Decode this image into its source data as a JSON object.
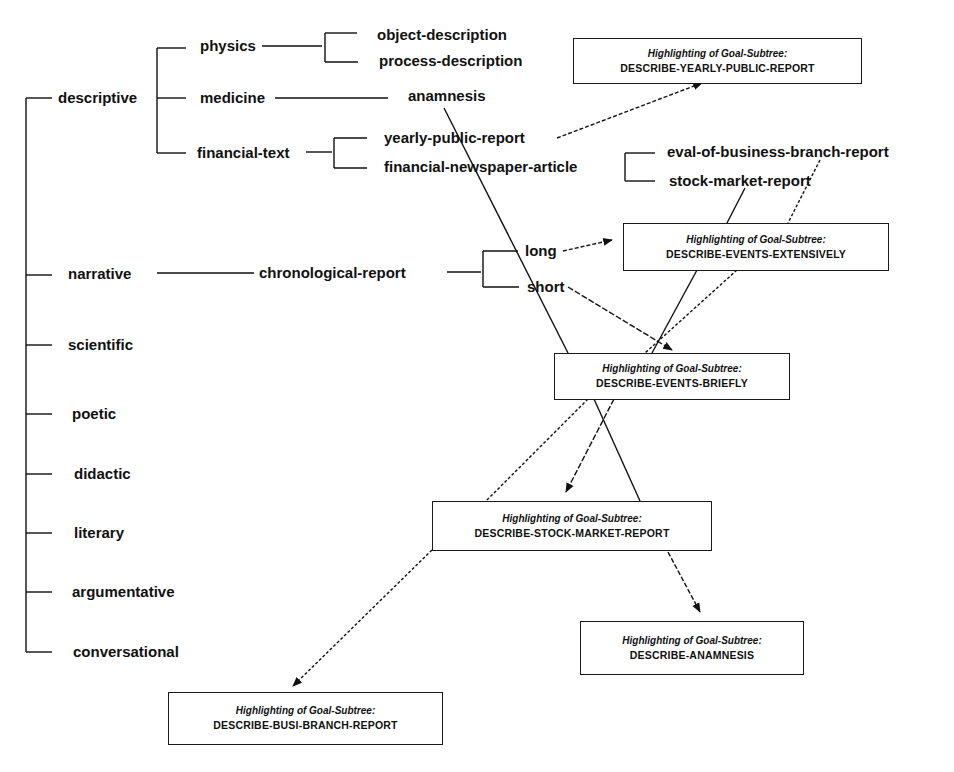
{
  "colors": {
    "ink": "#111111",
    "background": "#ffffff"
  },
  "tree": {
    "level1": [
      {
        "label": "descriptive"
      },
      {
        "label": "narrative"
      },
      {
        "label": "scientific"
      },
      {
        "label": "poetic"
      },
      {
        "label": "didactic"
      },
      {
        "label": "literary"
      },
      {
        "label": "argumentative"
      },
      {
        "label": "conversational"
      }
    ],
    "descriptive_children": [
      {
        "label": "physics"
      },
      {
        "label": "medicine"
      },
      {
        "label": "financial-text"
      }
    ],
    "physics_children": [
      {
        "label": "object-description"
      },
      {
        "label": "process-description"
      }
    ],
    "medicine_children": [
      {
        "label": "anamnesis"
      }
    ],
    "financial_children": [
      {
        "label": "yearly-public-report"
      },
      {
        "label": "financial-newspaper-article"
      }
    ],
    "newspaper_children": [
      {
        "label": "eval-of-business-branch-report"
      },
      {
        "label": "stock-market-report"
      }
    ],
    "narrative_children": [
      {
        "label": "chronological-report"
      }
    ],
    "chronological_children": [
      {
        "label": "long"
      },
      {
        "label": "short"
      }
    ]
  },
  "goal_boxes": [
    {
      "heading": "Highlighting of Goal-Subtree:",
      "goal": "DESCRIBE-YEARLY-PUBLIC-REPORT"
    },
    {
      "heading": "Highlighting of Goal-Subtree:",
      "goal": "DESCRIBE-EVENTS-EXTENSIVELY"
    },
    {
      "heading": "Highlighting of Goal-Subtree:",
      "goal": "DESCRIBE-EVENTS-BRIEFLY"
    },
    {
      "heading": "Highlighting of Goal-Subtree:",
      "goal": "DESCRIBE-STOCK-MARKET-REPORT"
    },
    {
      "heading": "Highlighting of Goal-Subtree:",
      "goal": "DESCRIBE-ANAMNESIS"
    },
    {
      "heading": "Highlighting of Goal-Subtree:",
      "goal": "DESCRIBE-BUSI-BRANCH-REPORT"
    }
  ]
}
